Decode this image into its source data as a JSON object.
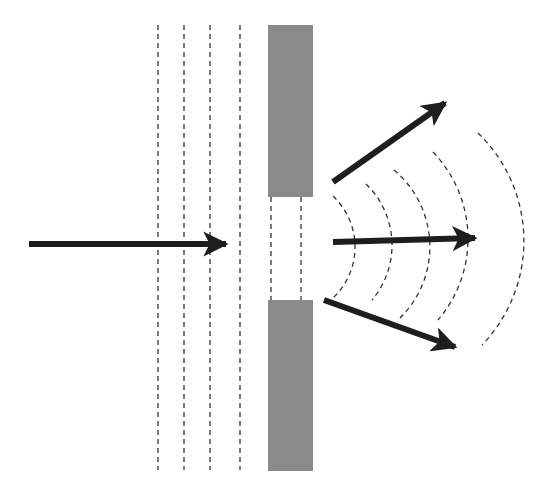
{
  "diagram": {
    "colors": {
      "background": "#ffffff",
      "barrier": "#8a8a8a",
      "arrow": "#1e1e1e",
      "wavefront": "#333333"
    },
    "elements": {
      "incident_wavefronts": 4,
      "barriers": 2,
      "slit": 1,
      "diffracted_wavefronts": 4,
      "outgoing_arrows": 3,
      "incident_arrow": 1
    }
  }
}
